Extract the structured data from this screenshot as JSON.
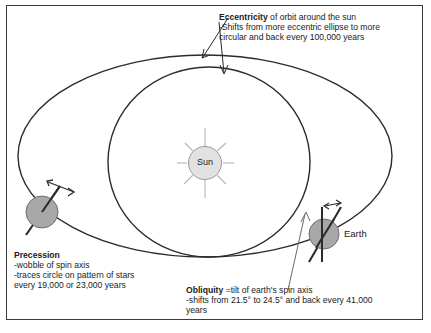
{
  "diagram": {
    "title_hidden": "",
    "border_color": "#3a3a3a",
    "background": "#ffffff",
    "orbit_line_color": "#2b2b2b",
    "body_fill": "#a8a8a8",
    "sun_fill": "#e2e2e2",
    "sun": {
      "label": "Sun",
      "rays": 8
    },
    "earth": {
      "label": "Earth"
    },
    "annotations": {
      "eccentricity": {
        "heading": "Eccentricity",
        "heading_rest": " of orbit around the sun",
        "line2": "-Shifts from more eccentric ellipse to more",
        "line3": "circular and back every 100,000 years"
      },
      "precession": {
        "heading": "Precession",
        "line2": "-wobble of spin axis",
        "line3": "-traces circle on pattern of stars",
        "line4": "every 19,000 or 23,000 years"
      },
      "obliquity": {
        "heading": "Obliquity",
        "heading_rest": " =tilt of earth's spin axis",
        "line2": "-shifts from 21.5° to 24.5° and back every 41,000",
        "line3": "years"
      }
    }
  }
}
